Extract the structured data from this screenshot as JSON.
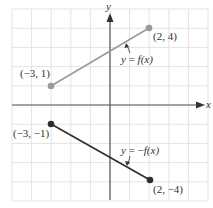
{
  "chart_data": {
    "type": "line",
    "title": "",
    "xlabel": "x",
    "ylabel": "y",
    "xlim": [
      -5,
      5
    ],
    "ylim": [
      -5,
      5
    ],
    "grid": true,
    "series": [
      {
        "name": "y = f(x)",
        "label": "y = f(x)",
        "color": "#9a9a9a",
        "points": [
          [
            -3,
            1
          ],
          [
            2,
            4
          ]
        ],
        "point_labels": [
          "(−3, 1)",
          "(2, 4)"
        ]
      },
      {
        "name": "y = −f(x)",
        "label": "y = −f(x)",
        "color": "#2e2e2e",
        "points": [
          [
            -3,
            -1
          ],
          [
            2,
            -4
          ]
        ],
        "point_labels": [
          "(−3, −1)",
          "(2, −4)"
        ]
      }
    ]
  },
  "colors": {
    "grid": "#e4e4e4",
    "axis": "#555555",
    "upper_line": "#9a9a9a",
    "lower_line": "#2e2e2e"
  },
  "axes": {
    "x_label": "x",
    "y_label": "y"
  },
  "labels": {
    "p1": "(−3, 1)",
    "p2": "(2, 4)",
    "p3": "(−3, −1)",
    "p4": "(2, −4)",
    "f_eq_prefix": "y = ",
    "f_eq": "f(x)",
    "neg_f_eq_prefix": "y = −",
    "neg_f_eq": "f(x)"
  }
}
